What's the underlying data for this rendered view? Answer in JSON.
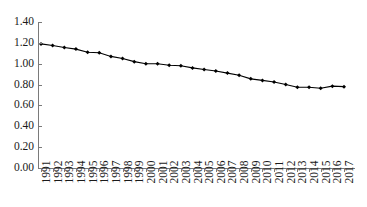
{
  "chart_data": {
    "type": "line",
    "title": "",
    "subtitle": "",
    "xlabel": "",
    "ylabel": "",
    "categories": [
      "1991",
      "1992",
      "1993",
      "1994",
      "1995",
      "1996",
      "1997",
      "1998",
      "1999",
      "2000",
      "2001",
      "2002",
      "2003",
      "2004",
      "2005",
      "2006",
      "2007",
      "2008",
      "2009",
      "2010",
      "2011",
      "2012",
      "2013",
      "2014",
      "2015",
      "2016",
      "2017"
    ],
    "values": [
      1.19,
      1.175,
      1.155,
      1.14,
      1.11,
      1.105,
      1.07,
      1.05,
      1.02,
      1.0,
      1.0,
      0.985,
      0.98,
      0.96,
      0.945,
      0.93,
      0.91,
      0.89,
      0.855,
      0.84,
      0.825,
      0.8,
      0.775,
      0.775,
      0.765,
      0.785,
      0.78
    ],
    "series": [
      {
        "name": "",
        "values": [
          1.19,
          1.175,
          1.155,
          1.14,
          1.11,
          1.105,
          1.07,
          1.05,
          1.02,
          1.0,
          1.0,
          0.985,
          0.98,
          0.96,
          0.945,
          0.93,
          0.91,
          0.89,
          0.855,
          0.84,
          0.825,
          0.8,
          0.775,
          0.775,
          0.765,
          0.785,
          0.78
        ],
        "color": "#000000",
        "marker": "diamond"
      }
    ],
    "ylim": [
      0.0,
      1.4
    ],
    "yticks": [
      0.0,
      0.2,
      0.4,
      0.6,
      0.8,
      1.0,
      1.2,
      1.4
    ],
    "ytick_labels": [
      "0.00",
      "0.20",
      "0.40",
      "0.60",
      "0.80",
      "1.00",
      "1.20",
      "1.40"
    ],
    "grid": false,
    "legend": null,
    "legend_position": "none",
    "annotations": [],
    "axis_color": "#7a7a7a",
    "line_color": "#000000"
  }
}
